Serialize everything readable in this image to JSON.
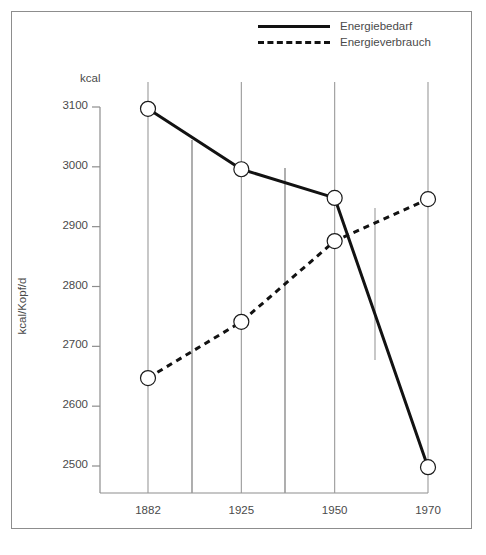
{
  "figure": {
    "background_color": "#ffffff",
    "border_color": "#8d8d8d"
  },
  "chart_data": {
    "type": "line",
    "title": "",
    "subtitle": "",
    "xlabel": "",
    "ylabel": "kcal/Kopf/d",
    "unit_note": "kcal",
    "categories": [
      "1882",
      "1925",
      "1950",
      "1970"
    ],
    "x": [
      1882,
      1925,
      1950,
      1970
    ],
    "xlim": [
      1882,
      1970
    ],
    "ylim": [
      2470,
      3130
    ],
    "ytick_labels": [
      "3100",
      "3000",
      "2900",
      "2800",
      "2700",
      "2600",
      "2500"
    ],
    "yticks": [
      3100,
      3000,
      2900,
      2800,
      2700,
      2600,
      2500
    ],
    "xtick_labels": [
      "1882",
      "1925",
      "1950",
      "1970"
    ],
    "grid": "vertical-only",
    "legend_position": "top-right",
    "marker": "open-circle",
    "series": [
      {
        "name": "Energiebedarf",
        "style": "solid",
        "color": "#121212",
        "line_width": 3,
        "values": [
          3097,
          2996,
          2948,
          2498
        ]
      },
      {
        "name": "Energieverbrauch",
        "style": "dashed",
        "color": "#121212",
        "line_width": 3,
        "values": [
          2647,
          2741,
          2876,
          2946
        ]
      }
    ],
    "annotations": []
  },
  "legend": {
    "entries": [
      {
        "label": "Energiebedarf",
        "style": "solid"
      },
      {
        "label": "Energieverbrauch",
        "style": "dashed"
      }
    ]
  },
  "axis": {
    "unit": "kcal",
    "y_title": "kcal/Kopf/d"
  }
}
